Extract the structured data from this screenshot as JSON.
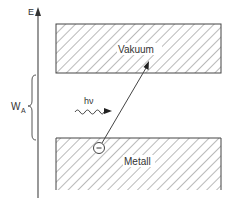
{
  "diagram": {
    "type": "energy-level-diagram",
    "axis": {
      "label": "E"
    },
    "work_function": {
      "symbol": "W",
      "subscript": "A"
    },
    "photon": {
      "label": "hν"
    },
    "electron": {
      "symbol": "−"
    },
    "regions": [
      {
        "name": "vacuum",
        "label": "Vakuum"
      },
      {
        "name": "metal",
        "label": "Metall"
      }
    ]
  },
  "colors": {
    "line": "#444444",
    "hatch": "#555555",
    "text": "#333333",
    "background": "#ffffff"
  }
}
